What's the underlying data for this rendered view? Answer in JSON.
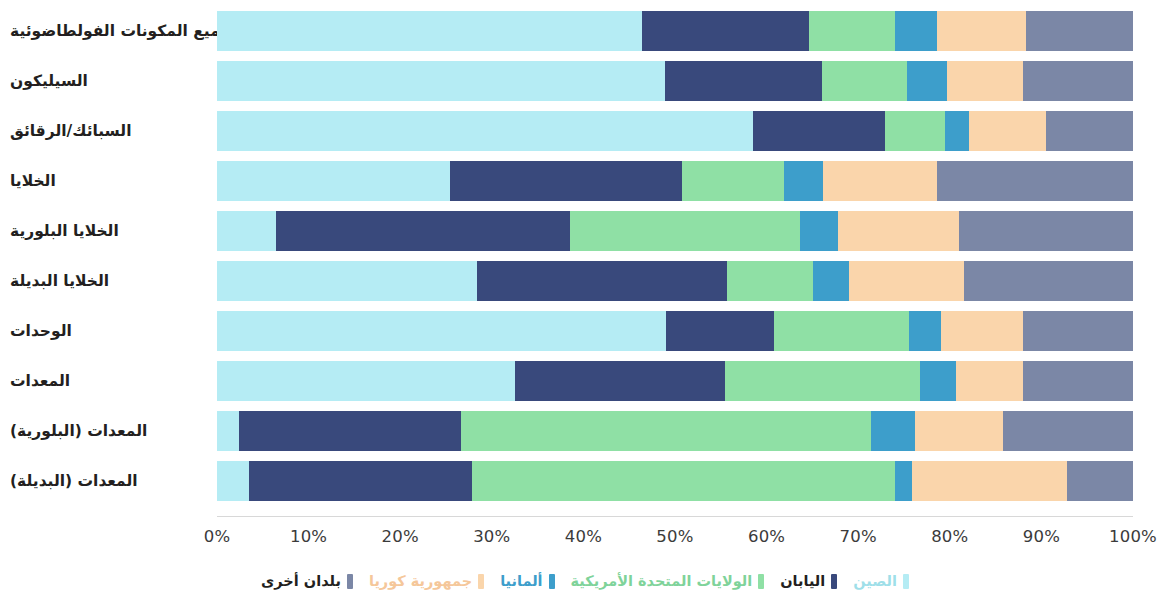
{
  "chart_data": {
    "type": "bar",
    "orientation": "horizontal",
    "stacked": true,
    "normalized": true,
    "title": "",
    "xlabel": "",
    "ylabel": "",
    "xlim": [
      0,
      100
    ],
    "grid": false,
    "legend_position": "bottom",
    "language": "ar",
    "direction": "rtl",
    "tick_labels": [
      "0%",
      "10%",
      "20%",
      "30%",
      "40%",
      "50%",
      "60%",
      "70%",
      "80%",
      "90%",
      "100%"
    ],
    "tick_values": [
      0,
      10,
      20,
      30,
      40,
      50,
      60,
      70,
      80,
      90,
      100
    ],
    "categories": [
      "جميع المكونات الفولطاضوئية",
      "السيليكون",
      "السبائك/الرقائق",
      "الخلايا",
      "الخلايا البلورية",
      "الخلايا البديلة",
      "الوحدات",
      "المعدات",
      "المعدات (البلورية)",
      "المعدات (البديلة)"
    ],
    "series": [
      {
        "name": "الصين",
        "color": "#b5ecf4",
        "values": [
          46.4,
          48.9,
          58.5,
          25.4,
          6.4,
          28.4,
          49.0,
          32.5,
          2.4,
          3.5
        ]
      },
      {
        "name": "اليابان",
        "color": "#39497c",
        "values": [
          18.2,
          17.1,
          14.4,
          25.4,
          32.1,
          27.3,
          11.8,
          23.0,
          24.2,
          24.3
        ]
      },
      {
        "name": "الولايات المتحدة الأمريكية",
        "color": "#8fe0a5",
        "values": [
          9.4,
          9.3,
          6.6,
          11.1,
          25.1,
          9.4,
          14.8,
          21.2,
          44.8,
          46.2
        ]
      },
      {
        "name": "ألمانيا",
        "color": "#3d9ecb",
        "values": [
          4.6,
          4.4,
          2.6,
          4.3,
          4.2,
          3.9,
          3.4,
          4.0,
          4.8,
          1.9
        ]
      },
      {
        "name": "جمهورية كوريا",
        "color": "#fad5ab",
        "values": [
          9.7,
          8.3,
          8.4,
          12.4,
          13.2,
          12.6,
          9.0,
          7.3,
          9.6,
          16.9
        ]
      },
      {
        "name": "بلدان أخرى",
        "color": "#7b87a6",
        "values": [
          11.7,
          12.0,
          9.5,
          21.4,
          19.0,
          18.4,
          12.0,
          12.0,
          14.2,
          7.2
        ]
      }
    ]
  }
}
